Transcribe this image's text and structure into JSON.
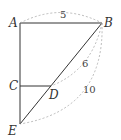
{
  "diagram": {
    "points": {
      "A": {
        "label": "A",
        "x": 20,
        "y": 23
      },
      "B": {
        "label": "B",
        "x": 102,
        "y": 23
      },
      "C": {
        "label": "C",
        "x": 20,
        "y": 86
      },
      "D": {
        "label": "D",
        "x": 51,
        "y": 86
      },
      "E": {
        "label": "E",
        "x": 20,
        "y": 124
      }
    },
    "measurements": {
      "AB": "5",
      "BD": "6",
      "BE": "10"
    },
    "colors": {
      "line": "#333333",
      "dashed": "#aaaaaa"
    }
  }
}
